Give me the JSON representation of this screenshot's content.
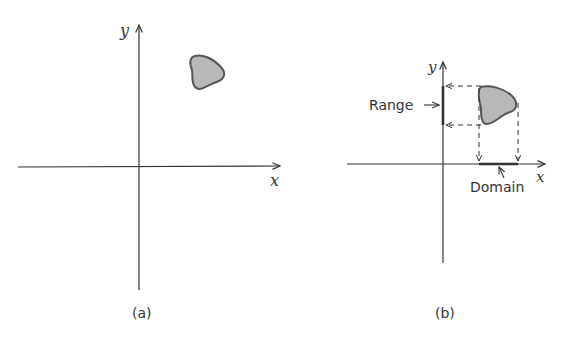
{
  "panel_a": {
    "caption": "(a)",
    "x_label": "x",
    "y_label": "y"
  },
  "panel_b": {
    "caption": "(b)",
    "x_label": "x",
    "y_label": "y",
    "range_label": "Range",
    "domain_label": "Domain"
  },
  "colors": {
    "axis": "#333333",
    "region_fill": "#b8b8b8",
    "region_stroke": "#555555"
  }
}
